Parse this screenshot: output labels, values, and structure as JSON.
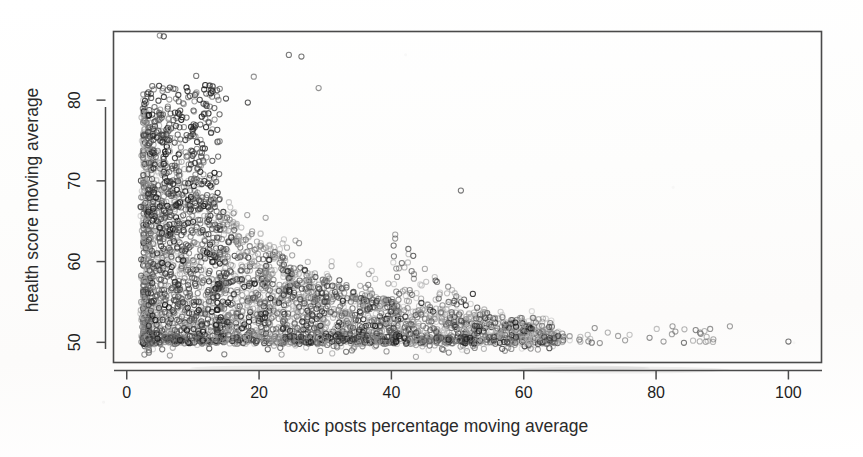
{
  "figure": {
    "kind": "scatterplot",
    "background_color": "#ffffff",
    "frame_color": "#4a4a4a",
    "point_style": "open-circle",
    "point_radius_px": 2.6
  },
  "chart_data": {
    "type": "scatter",
    "title": "",
    "xlabel": "toxic posts percentage moving average",
    "ylabel": "health score moving average",
    "xlim": [
      -2,
      105
    ],
    "ylim": [
      47.5,
      88.5
    ],
    "xticks": [
      0,
      20,
      40,
      60,
      80,
      100
    ],
    "yticks": [
      50,
      60,
      70,
      80
    ],
    "xtick_labels": [
      "0",
      "20",
      "40",
      "60",
      "80",
      "100"
    ],
    "ytick_labels": [
      "50",
      "60",
      "70",
      "80"
    ],
    "grid": false,
    "legend": null,
    "n_points_drawn": 2400,
    "marker": "open circle",
    "marker_colors": [
      "#1a1a1a",
      "#3d3d3d",
      "#606060",
      "#808080",
      "#9e9e9e",
      "#b8b8b8"
    ],
    "series": [
      {
        "name": "communities",
        "x_range": [
          2.5,
          100
        ],
        "y_range": [
          49.6,
          88.0
        ],
        "outliers": [
          {
            "x": 5.0,
            "y": 88.0
          },
          {
            "x": 5.6,
            "y": 87.9
          },
          {
            "x": 24.5,
            "y": 85.6
          },
          {
            "x": 26.4,
            "y": 85.4
          },
          {
            "x": 10.5,
            "y": 83.0
          },
          {
            "x": 19.2,
            "y": 82.9
          },
          {
            "x": 29.0,
            "y": 81.5
          },
          {
            "x": 15.0,
            "y": 80.2
          },
          {
            "x": 18.3,
            "y": 79.7
          },
          {
            "x": 50.5,
            "y": 68.8
          },
          {
            "x": 100.0,
            "y": 50.1
          }
        ]
      }
    ]
  },
  "axes": {
    "x_axis_name": "toxic posts percentage moving average",
    "y_axis_name": "health score moving average"
  }
}
